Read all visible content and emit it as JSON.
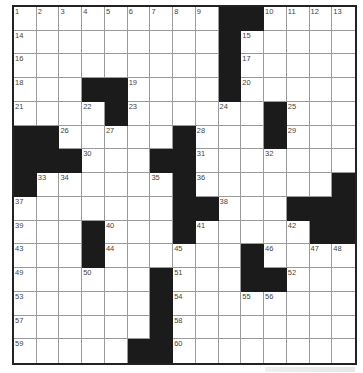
{
  "puzzle": {
    "rows": 15,
    "cols": 15,
    "colors": {
      "black": "#1b1b1b",
      "line": "#9a9a9a",
      "border": "#222222",
      "number": "#444444"
    },
    "blacks": [
      [
        0,
        9
      ],
      [
        0,
        10
      ],
      [
        1,
        9
      ],
      [
        2,
        9
      ],
      [
        3,
        3
      ],
      [
        3,
        4
      ],
      [
        3,
        9
      ],
      [
        4,
        4
      ],
      [
        4,
        11
      ],
      [
        5,
        0
      ],
      [
        5,
        1
      ],
      [
        5,
        7
      ],
      [
        5,
        11
      ],
      [
        6,
        0
      ],
      [
        6,
        1
      ],
      [
        6,
        2
      ],
      [
        6,
        6
      ],
      [
        6,
        7
      ],
      [
        7,
        0
      ],
      [
        7,
        7
      ],
      [
        7,
        14
      ],
      [
        8,
        7
      ],
      [
        8,
        8
      ],
      [
        8,
        12
      ],
      [
        8,
        13
      ],
      [
        8,
        14
      ],
      [
        9,
        3
      ],
      [
        9,
        7
      ],
      [
        9,
        13
      ],
      [
        9,
        14
      ],
      [
        10,
        3
      ],
      [
        10,
        10
      ],
      [
        11,
        6
      ],
      [
        11,
        10
      ],
      [
        11,
        11
      ],
      [
        12,
        6
      ],
      [
        13,
        6
      ],
      [
        14,
        5
      ],
      [
        14,
        6
      ]
    ],
    "numbers": [
      [
        0,
        0,
        "1"
      ],
      [
        0,
        1,
        "2"
      ],
      [
        0,
        2,
        "3"
      ],
      [
        0,
        3,
        "4"
      ],
      [
        0,
        4,
        "5"
      ],
      [
        0,
        5,
        "6"
      ],
      [
        0,
        6,
        "7"
      ],
      [
        0,
        7,
        "8"
      ],
      [
        0,
        8,
        "9"
      ],
      [
        0,
        11,
        "10"
      ],
      [
        0,
        12,
        "11"
      ],
      [
        0,
        13,
        "12"
      ],
      [
        0,
        14,
        "13"
      ],
      [
        1,
        0,
        "14"
      ],
      [
        1,
        10,
        "15"
      ],
      [
        2,
        0,
        "16"
      ],
      [
        2,
        10,
        "17"
      ],
      [
        3,
        0,
        "18"
      ],
      [
        3,
        5,
        "19"
      ],
      [
        3,
        10,
        "20"
      ],
      [
        4,
        0,
        "21"
      ],
      [
        4,
        3,
        "22"
      ],
      [
        4,
        5,
        "23"
      ],
      [
        4,
        9,
        "24"
      ],
      [
        4,
        12,
        "25"
      ],
      [
        5,
        2,
        "26"
      ],
      [
        5,
        4,
        "27"
      ],
      [
        5,
        8,
        "28"
      ],
      [
        5,
        12,
        "29"
      ],
      [
        6,
        3,
        "30"
      ],
      [
        6,
        8,
        "31"
      ],
      [
        6,
        11,
        "32"
      ],
      [
        7,
        1,
        "33"
      ],
      [
        7,
        2,
        "34"
      ],
      [
        7,
        6,
        "35"
      ],
      [
        7,
        8,
        "36"
      ],
      [
        8,
        0,
        "37"
      ],
      [
        8,
        9,
        "38"
      ],
      [
        9,
        0,
        "39"
      ],
      [
        9,
        4,
        "40"
      ],
      [
        9,
        8,
        "41"
      ],
      [
        9,
        12,
        "42"
      ],
      [
        10,
        0,
        "43"
      ],
      [
        10,
        4,
        "44"
      ],
      [
        10,
        7,
        "45"
      ],
      [
        10,
        11,
        "46"
      ],
      [
        10,
        13,
        "47"
      ],
      [
        10,
        14,
        "48"
      ],
      [
        11,
        0,
        "49"
      ],
      [
        11,
        3,
        "50"
      ],
      [
        11,
        7,
        "51"
      ],
      [
        11,
        12,
        "52"
      ],
      [
        12,
        0,
        "53"
      ],
      [
        12,
        7,
        "54"
      ],
      [
        12,
        10,
        "55"
      ],
      [
        12,
        11,
        "56"
      ],
      [
        13,
        0,
        "57"
      ],
      [
        13,
        7,
        "58"
      ],
      [
        14,
        0,
        "59"
      ],
      [
        14,
        7,
        "60"
      ]
    ]
  }
}
